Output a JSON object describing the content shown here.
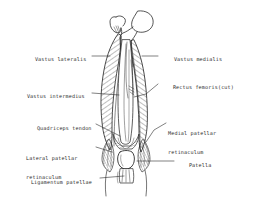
{
  "figure": {
    "style": "hand-drawn ink line diagram with hatched shading",
    "background_color": "#ffffff",
    "ink_color": "#2b2b2b"
  },
  "labels": [
    {
      "id": "vastus-lateralis",
      "text": "Vastus lateralis",
      "text2": "",
      "side": "left",
      "x": 22,
      "y": 53
    },
    {
      "id": "vastus-medialis",
      "text": "Vastus medialis",
      "text2": "",
      "side": "right",
      "x": 161,
      "y": 53
    },
    {
      "id": "vastus-intermedius",
      "text": "Vastus intermedius",
      "text2": "",
      "side": "left",
      "x": 14,
      "y": 90
    },
    {
      "id": "rectus-femoris-cut",
      "text": "Rectus femoris(cut)",
      "text2": "",
      "side": "right",
      "x": 160,
      "y": 80
    },
    {
      "id": "quadriceps-tendon",
      "text": "Quadriceps tendon",
      "text2": "",
      "side": "left",
      "x": 24,
      "y": 122
    },
    {
      "id": "medial-patellar-retinaculum",
      "text": "Medial patellar",
      "text2": "retinaculum",
      "side": "right",
      "x": 168,
      "y": 120
    },
    {
      "id": "lateral-patellar-retinaculum",
      "text": "Lateral patellar",
      "text2": "retinaculum",
      "side": "left",
      "x": 26,
      "y": 145
    },
    {
      "id": "patella",
      "text": "Patella",
      "text2": "",
      "side": "right",
      "x": 176,
      "y": 159
    },
    {
      "id": "ligamentum-patellae",
      "text": "Ligamentum patellae",
      "text2": "",
      "side": "left",
      "x": 18,
      "y": 176
    }
  ],
  "anatomy_parts": [
    "femur-head",
    "greater-trochanter",
    "femur-shaft",
    "vastus-lateralis-belly",
    "vastus-medialis-belly",
    "vastus-intermedius-belly",
    "rectus-femoris-cut-stump",
    "quadriceps-tendon",
    "patella",
    "ligamentum-patellae",
    "medial-patellar-retinaculum",
    "lateral-patellar-retinaculum"
  ]
}
